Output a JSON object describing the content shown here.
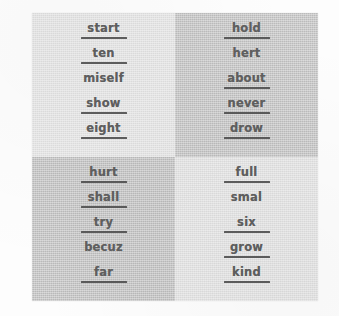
{
  "worksheet": {
    "title": "word-list-grid",
    "layout": {
      "rows": 2,
      "cols": 2,
      "words_per_cell": 5
    },
    "page_background": "#fdfdfd",
    "text_color": "#5f5f5f",
    "rule_color": "#4a4a4a",
    "quadrants": [
      {
        "name": "top-left",
        "background": "#e3e3e3",
        "words": [
          {
            "text": "start",
            "underlined": true
          },
          {
            "text": "ten",
            "underlined": true
          },
          {
            "text": "miself",
            "underlined": false
          },
          {
            "text": "show",
            "underlined": true
          },
          {
            "text": "eight",
            "underlined": true
          }
        ]
      },
      {
        "name": "top-right",
        "background": "#bfbfbf",
        "words": [
          {
            "text": "hold",
            "underlined": true
          },
          {
            "text": "hert",
            "underlined": false
          },
          {
            "text": "about",
            "underlined": true
          },
          {
            "text": "never",
            "underlined": true
          },
          {
            "text": "drow",
            "underlined": true
          }
        ]
      },
      {
        "name": "bottom-left",
        "background": "#bdbdbd",
        "words": [
          {
            "text": "hurt",
            "underlined": true
          },
          {
            "text": "shall",
            "underlined": true
          },
          {
            "text": "try",
            "underlined": true
          },
          {
            "text": "becuz",
            "underlined": false
          },
          {
            "text": "far",
            "underlined": true
          }
        ]
      },
      {
        "name": "bottom-right",
        "background": "#e1e1e1",
        "words": [
          {
            "text": "full",
            "underlined": true
          },
          {
            "text": "smal",
            "underlined": false
          },
          {
            "text": "six",
            "underlined": true
          },
          {
            "text": "grow",
            "underlined": true
          },
          {
            "text": "kind",
            "underlined": true
          }
        ]
      }
    ]
  }
}
